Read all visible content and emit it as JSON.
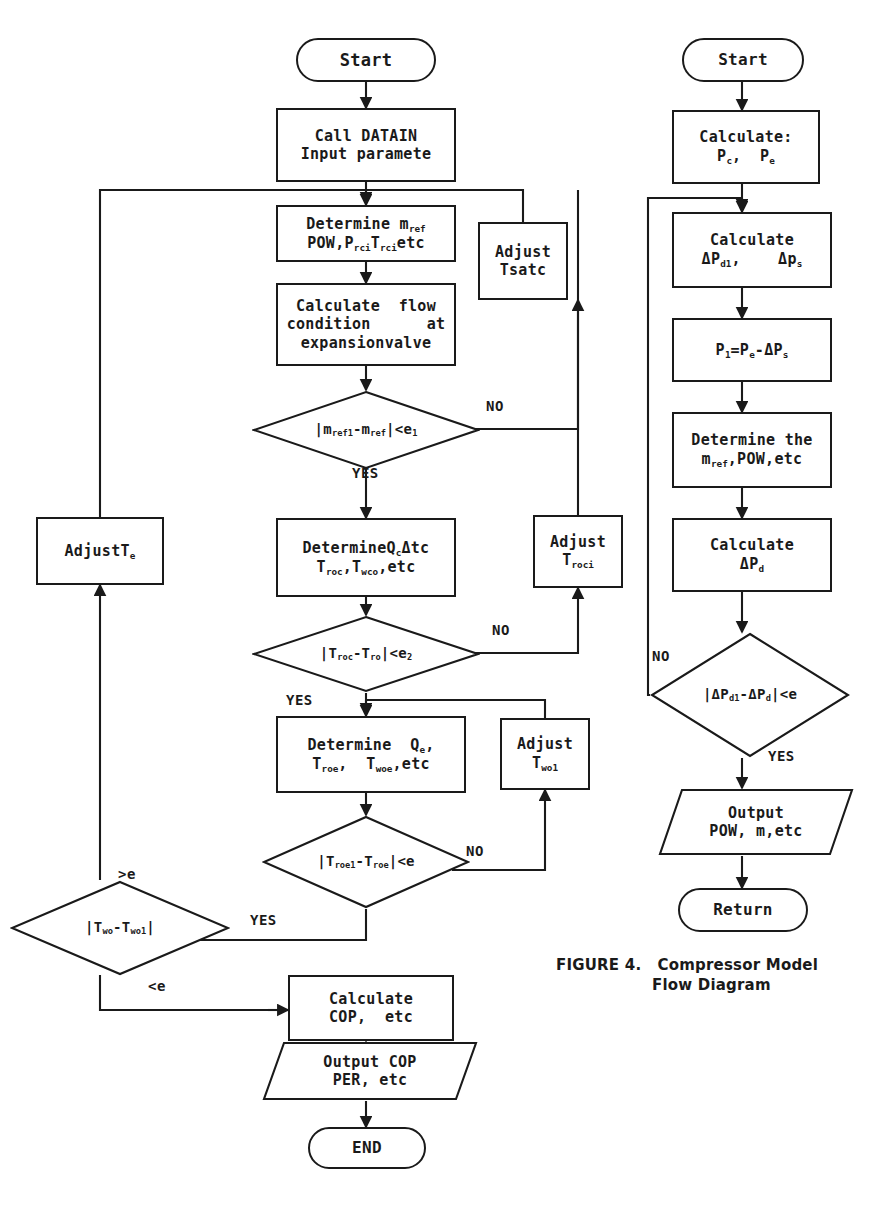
{
  "figure": {
    "caption_line1": "FIGURE 4.   Compressor Model",
    "caption_line2": "Flow Diagram"
  },
  "left_flow": {
    "title": "System Model Flow Diagram",
    "nodes": [
      {
        "id": "start",
        "type": "terminator",
        "label": "Start"
      },
      {
        "id": "datain",
        "type": "process",
        "line1": "Call DATAIN",
        "line2": "Input paramete"
      },
      {
        "id": "determine_m",
        "type": "process",
        "line1": "Determine m",
        "line1_sub": "ref",
        "line2": "POW,P",
        "line2_sub": "rci",
        "line2b": "T",
        "line2b_sub": "rci",
        "line2c": "etc",
        "text": "Determine m_ref\nPOW,P_rci,T_rci,etc"
      },
      {
        "id": "calc_flow",
        "type": "process",
        "line1": "Calculate  flow",
        "line2": "condition      at",
        "line3": "expansionvalve"
      },
      {
        "id": "adjust_tsatc",
        "type": "process",
        "line1": "Adjust",
        "line2": "Tsatc"
      },
      {
        "id": "dec_mref",
        "type": "decision",
        "text": "|m_ref1-m_ref|<e1"
      },
      {
        "id": "determine_q",
        "type": "process",
        "line1": "DetermineQ_cΔtc",
        "line2": "T_roc,T_wco,etc"
      },
      {
        "id": "adjust_troci",
        "type": "process",
        "line1": "Adjust",
        "line2": "T_roci"
      },
      {
        "id": "adjust_te",
        "type": "process",
        "line1": "AdjustT_e"
      },
      {
        "id": "dec_troc",
        "type": "decision",
        "text": "|T_roc-T_ro|<e2"
      },
      {
        "id": "determine_qe",
        "type": "process",
        "line1": "Determine  Q_e,",
        "line2": "T_roe,  T_woe,etc"
      },
      {
        "id": "adjust_two1",
        "type": "process",
        "line1": "Adjust",
        "line2": "T_wo1"
      },
      {
        "id": "dec_troe",
        "type": "decision",
        "text": "|T_roe1-T_roe|<e"
      },
      {
        "id": "dec_two",
        "type": "decision",
        "text": "|T_wo-T_wo1|"
      },
      {
        "id": "calc_cop",
        "type": "process",
        "line1": "Calculate",
        "line2": "COP,  etc"
      },
      {
        "id": "output_cop",
        "type": "io",
        "line1": "Output COP",
        "line2": "PER, etc"
      },
      {
        "id": "end",
        "type": "terminator",
        "label": "END"
      }
    ],
    "edge_labels": [
      {
        "id": "no1",
        "text": "NO"
      },
      {
        "id": "yes1",
        "text": "YES"
      },
      {
        "id": "no2",
        "text": "NO"
      },
      {
        "id": "yes2",
        "text": "YES"
      },
      {
        "id": "no3",
        "text": "NO"
      },
      {
        "id": "yes3",
        "text": "YES"
      },
      {
        "id": "gt_e",
        "text": ">e"
      },
      {
        "id": "lt_e",
        "text": "<e"
      }
    ]
  },
  "right_flow": {
    "nodes": [
      {
        "id": "r_start",
        "type": "terminator",
        "label": "Start"
      },
      {
        "id": "r_calc_p",
        "type": "process",
        "line1": "Calculate:",
        "line2": "Pc,  Pe"
      },
      {
        "id": "r_calc_dp",
        "type": "process",
        "line1": "Calculate",
        "line2": "ΔP_d1,     Δp_s"
      },
      {
        "id": "r_p1",
        "type": "process",
        "line1": "P1=Pe-ΔPs"
      },
      {
        "id": "r_determine",
        "type": "process",
        "line1": "Determine the",
        "line2": "m_ref,POW,etc"
      },
      {
        "id": "r_calc_dpd",
        "type": "process",
        "line1": "Calculate",
        "line2": "ΔP_d"
      },
      {
        "id": "r_dec",
        "type": "decision",
        "text": "|ΔP_d1-ΔP_d|<e"
      },
      {
        "id": "r_output",
        "type": "io",
        "line1": "Output",
        "line2": "POW, m,etc"
      },
      {
        "id": "r_return",
        "type": "terminator",
        "label": "Return"
      }
    ],
    "edge_labels": [
      {
        "id": "r_no",
        "text": "NO"
      },
      {
        "id": "r_yes",
        "text": "YES"
      }
    ]
  },
  "style": {
    "ink": "#1a1a1a",
    "paper": "#ffffff"
  }
}
